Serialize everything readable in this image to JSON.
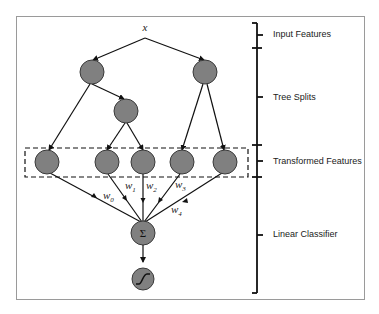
{
  "diagram": {
    "input_symbol": "x",
    "node_color": "#808080",
    "node_stroke": "#3a3a3a",
    "sum_symbol": "Σ",
    "weights": [
      {
        "base": "w",
        "sub": "0"
      },
      {
        "base": "w",
        "sub": "1"
      },
      {
        "base": "w",
        "sub": "2"
      },
      {
        "base": "w",
        "sub": "3"
      },
      {
        "base": "w",
        "sub": "4"
      }
    ],
    "stages": [
      {
        "label": "Input Features"
      },
      {
        "label": "Tree Splits"
      },
      {
        "label": "Transformed Features"
      },
      {
        "label": "Linear Classifier"
      }
    ]
  }
}
